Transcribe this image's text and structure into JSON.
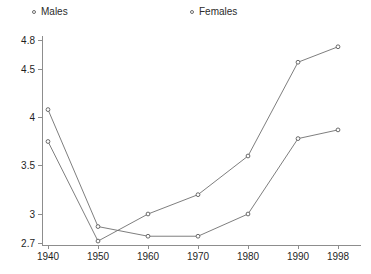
{
  "chart_data": {
    "type": "line",
    "title": "",
    "subtitle": "",
    "xlabel": "",
    "ylabel": "",
    "x": [
      1940,
      1950,
      1960,
      1970,
      1980,
      1990,
      1998
    ],
    "xtick_labels": [
      "1940",
      "1950",
      "1960",
      "1970",
      "1980",
      "1990",
      "1998"
    ],
    "ytick_values": [
      2.7,
      3,
      3.5,
      4,
      4.5,
      4.8
    ],
    "ytick_labels": [
      "2.7",
      "3",
      "3.5",
      "4",
      "4.5",
      "4.8"
    ],
    "ylim": [
      2.7,
      4.8
    ],
    "xlim": [
      1940,
      1998
    ],
    "grid": false,
    "legend_position": "top",
    "series": [
      {
        "name": "Males",
        "marker": "open-circle",
        "color": "#6f6f6f",
        "values": [
          4.08,
          2.87,
          2.77,
          2.77,
          3.0,
          3.78,
          3.87
        ]
      },
      {
        "name": "Females",
        "marker": "open-circle",
        "color": "#6f6f6f",
        "values": [
          3.75,
          2.72,
          3.0,
          3.2,
          3.6,
          4.57,
          4.73
        ]
      }
    ]
  },
  "legend": {
    "males": {
      "label": "Males",
      "marker_name": "open-circle-marker"
    },
    "females": {
      "label": "Females",
      "marker_name": "open-circle-marker"
    }
  },
  "axes": {
    "y_axis_name": "y-axis",
    "x_axis_name": "x-axis"
  }
}
